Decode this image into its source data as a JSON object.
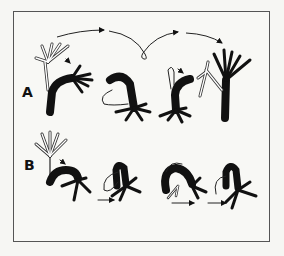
{
  "figure": {
    "rows": [
      {
        "label": "A",
        "description": "somersault locomotion sequence",
        "stages": 4
      },
      {
        "label": "B",
        "description": "looping (inchworm) locomotion sequence",
        "stages": 4
      }
    ],
    "colors": {
      "ink": "#111111",
      "background": "#f8f8f5",
      "frame": "#555555"
    }
  }
}
